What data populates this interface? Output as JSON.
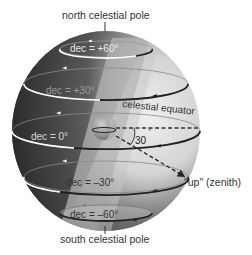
{
  "labels": {
    "north_pole": "north celestial pole",
    "south_pole": "south celestial pole",
    "celestial_equator": "celestial equator",
    "zenith": "\"up\" (zenith)",
    "angle": "30",
    "angle_unit": "°"
  },
  "declination_circles": [
    {
      "label": "dec = +60°",
      "dec": 60
    },
    {
      "label": "dec = +30°",
      "dec": 30
    },
    {
      "label": "dec = 0°",
      "dec": 0
    },
    {
      "label": "dec = –30°",
      "dec": -30
    },
    {
      "label": "dec = –60°",
      "dec": -60
    }
  ],
  "colors": {
    "sphere_dark": "#2b2b2b",
    "sphere_light": "#d9d9d9",
    "equator_plane": "#b8b8b8",
    "circle_front_light": "#ffffff",
    "circle_front_dark": "#222222",
    "earth": "#9a9a9a"
  }
}
